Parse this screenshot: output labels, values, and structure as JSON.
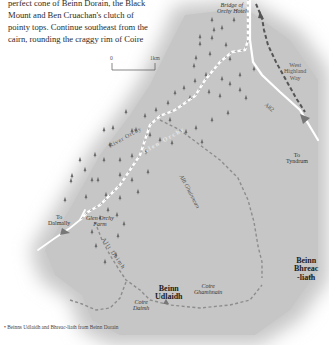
{
  "intro_text": {
    "lines": [
      "perfect cone of Beinn Dorain, the Black",
      "Mount and Ben Cruachan's clutch of",
      "pointy tops. Continue southeast from the",
      "cairn, rounding the craggy rim of Coire"
    ]
  },
  "map": {
    "scale": {
      "start": "0",
      "end": "1km"
    },
    "labels": {
      "bridge_of_orchy_hotel": [
        "Bridge of",
        "Orchy Hotel"
      ],
      "west_highland_way": [
        "West",
        "Highland",
        "Way"
      ],
      "a82": "A82",
      "to_tyndrum": [
        "To",
        "Tyndrum"
      ],
      "river_orchy": "River Orchy",
      "glen_orchy": "Glen Orchy",
      "allt_ghuinnean": "Allt Ghuinnean",
      "to_dalmally": [
        "To",
        "Dalmally"
      ],
      "glen_orchy_farm": [
        "Glen Orchy",
        "Farm"
      ],
      "allt_daimh": "Allt Daimh",
      "beinn_udlaidh": [
        "Beinn",
        "Udlaidh"
      ],
      "coire_ghamhnain": [
        "Coire",
        "Ghamhnain"
      ],
      "coire_daimh": [
        "Coire",
        "Daimh"
      ],
      "beinn_bhreac_liath": [
        "Beinn",
        "Bhreac",
        "-liath"
      ]
    },
    "colors": {
      "land": "#c9c9c9",
      "route": "#8f8f8f",
      "whw_route": "#555555",
      "road": "#ffffff",
      "river_path": "#ffffff",
      "tree": "#6a6a6a"
    }
  },
  "caption": {
    "text": "• Beinns Udlaidh and Bhreac-liath from Beinn Dorain"
  }
}
